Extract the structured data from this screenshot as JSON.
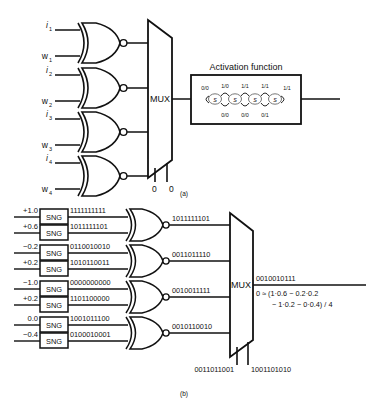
{
  "figure": {
    "caption_a": "(a)",
    "caption_b": "(b)"
  },
  "panel_a": {
    "gate_inputs": [
      {
        "i": "i",
        "i_sub": "1",
        "w": "w",
        "w_sub": "1"
      },
      {
        "i": "i",
        "i_sub": "2",
        "w": "w",
        "w_sub": "2"
      },
      {
        "i": "i",
        "i_sub": "3",
        "w": "w",
        "w_sub": "3"
      },
      {
        "i": "i",
        "i_sub": "4",
        "w": "w",
        "w_sub": "4"
      }
    ],
    "mux_label": "MUX",
    "select_labels": [
      "0",
      "0"
    ],
    "activation": {
      "title": "Activation function",
      "states": [
        "S",
        "S",
        "S",
        "S"
      ],
      "state_subs": [
        "1",
        "2",
        "3",
        "4"
      ],
      "entry_label": "0/0",
      "exit_label": "1/1",
      "top_labels": [
        "1/0",
        "1/1",
        "1/1"
      ],
      "bottom_labels": [
        "0/0",
        "0/0",
        "0/1"
      ]
    }
  },
  "panel_b": {
    "sng_label": "SNG",
    "rows": [
      {
        "value": "+1.0",
        "bits": "1111111111"
      },
      {
        "value": "+0.6",
        "bits": "1011111101"
      },
      {
        "value": "−0.2",
        "bits": "0110010010"
      },
      {
        "value": "+0.2",
        "bits": "1010110011"
      },
      {
        "value": "−1.0",
        "bits": "0000000000"
      },
      {
        "value": "+0.2",
        "bits": "1101100000"
      },
      {
        "value": "0.0",
        "bits": "1001011100"
      },
      {
        "value": "−0.4",
        "bits": "0100010001"
      }
    ],
    "gate_outputs": [
      "1011111101",
      "0011011110",
      "0010011111",
      "0010110010"
    ],
    "mux_label": "MUX",
    "mux_output": "0010010111",
    "select_bits": [
      "0011011001",
      "1001101010"
    ],
    "equation_line1": "0 ≈ (1·0.6 − 0.2·0.2",
    "equation_line2": "− 1·0.2 − 0·0.4) / 4"
  }
}
